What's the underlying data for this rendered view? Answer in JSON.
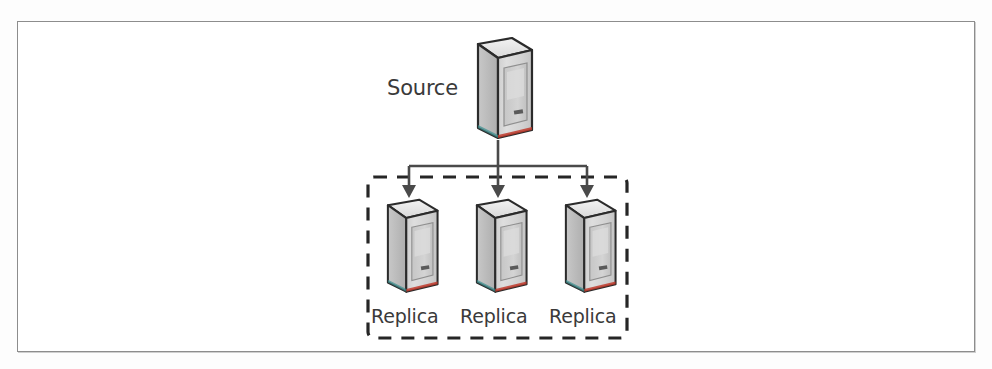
{
  "figure": {
    "type": "diagram",
    "subtype": "replication-topology",
    "source": {
      "label": "Source",
      "icon": "server-tower-icon"
    },
    "replica_group": {
      "boundary": "dashed-box",
      "replicas": [
        {
          "label": "Replica",
          "icon": "server-tower-icon"
        },
        {
          "label": "Replica",
          "icon": "server-tower-icon"
        },
        {
          "label": "Replica",
          "icon": "server-tower-icon"
        }
      ]
    },
    "connectors": {
      "count": 3,
      "style": "solid-line-with-arrowhead",
      "direction": "source-to-replicas"
    },
    "colors": {
      "line": "#4a4a4a",
      "dash": "#262626",
      "tower_front": "#d8d8d8",
      "tower_side": "#bfbfbf",
      "tower_top": "#ececec",
      "tower_outline": "#2b2b2b",
      "text": "#3a3a3a",
      "frame": "#8d8d8d",
      "accent_red": "#c0392b",
      "accent_teal": "#3a8f8f",
      "page_background": "#ffffff"
    }
  }
}
